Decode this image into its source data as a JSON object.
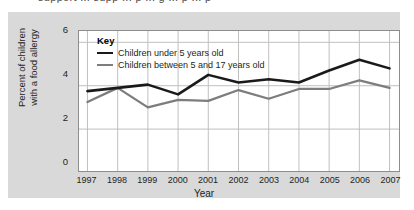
{
  "page": {
    "top_fragment": "support  ...  supp   ...  p   ...  g  ...  p  ...  p"
  },
  "legend": {
    "title": "Key",
    "entries": [
      {
        "label": "Children under 5 years old",
        "color": "#1a1a1a",
        "swatch": "line-black"
      },
      {
        "label": "Children between 5 and 17 years old",
        "color": "#7d7d7d",
        "swatch": "line-grey"
      }
    ]
  },
  "axes": {
    "y_title_line1": "Percent of children",
    "y_title_line2": "with a food allergy",
    "y_ticks": [
      "6",
      "4",
      "2",
      "0"
    ],
    "x_label": "Year"
  },
  "chart_data": {
    "type": "line",
    "title": "",
    "xlabel": "Year",
    "ylabel": "Percent of children with a food allergy",
    "categories": [
      "1997",
      "1998",
      "1999",
      "2000",
      "2001",
      "2002",
      "2003",
      "2004",
      "2005",
      "2006",
      "2007"
    ],
    "ylim": [
      0,
      6.4
    ],
    "y_ticks": [
      0,
      2,
      4,
      6
    ],
    "grid": true,
    "legend_position": "inside-top-left",
    "series": [
      {
        "name": "Children under 5 years old",
        "color": "#1a1a1a",
        "values": [
          3.75,
          3.9,
          4.05,
          3.6,
          4.5,
          4.15,
          4.3,
          4.15,
          4.7,
          5.2,
          4.8
        ]
      },
      {
        "name": "Children between 5 and 17 years old",
        "color": "#7d7d7d",
        "values": [
          3.25,
          3.9,
          3.0,
          3.35,
          3.3,
          3.8,
          3.4,
          3.85,
          3.85,
          4.25,
          3.9
        ]
      }
    ]
  }
}
